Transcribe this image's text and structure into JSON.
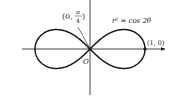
{
  "figure": {
    "type": "lemniscate",
    "equation_label": "r² = cos 2θ",
    "point_label_right": "(1, 0)",
    "point_label_origin_tangent": {
      "open": "(0,",
      "numerator": "π",
      "denominator": "4",
      "close": ")"
    },
    "origin_label": "O",
    "stroke_color": "#1a1a1a"
  }
}
